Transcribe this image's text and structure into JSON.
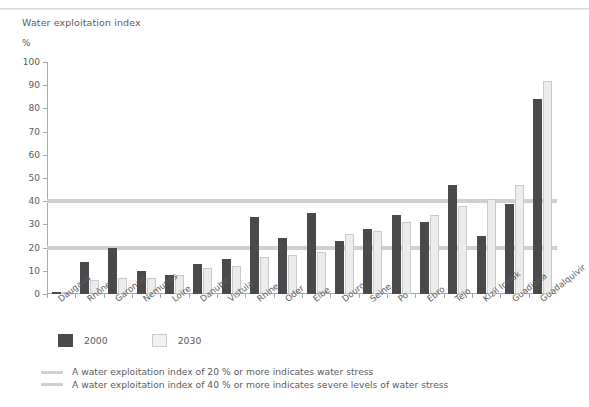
{
  "title": "Water exploitation index",
  "unit": "%",
  "legend": {
    "series1": "2000",
    "series2": "2030"
  },
  "notes": [
    "A water exploitation index of 20 % or more indicates water stress",
    "A water exploitation index of 40 % or more indicates severe levels of water stress"
  ],
  "colors": {
    "series_2000": "#4a4a4d",
    "series_2030": "#ececea",
    "reference_line": "#cfd0d2",
    "axis": "#a9aaad",
    "text": "#5b5c60"
  },
  "chart_data": {
    "type": "bar",
    "title": "Water exploitation index",
    "xlabel": "",
    "ylabel": "%",
    "ylim": [
      0,
      100
    ],
    "yticks": [
      0,
      10,
      20,
      30,
      40,
      50,
      60,
      70,
      80,
      90,
      100
    ],
    "grid": false,
    "legend_position": "below-left",
    "categories": [
      "Daugava",
      "Rhône",
      "Garonne",
      "Nemunas",
      "Loire",
      "Danube",
      "Vistula",
      "Rhine",
      "Oder",
      "Elbe",
      "Douro",
      "Seine",
      "Po",
      "Ebro",
      "Tejo",
      "Kizil Irmak",
      "Guadiana",
      "Guadalquivir"
    ],
    "series": [
      {
        "name": "2000",
        "color": "#4a4a4d",
        "values": [
          1,
          14,
          20,
          10,
          8,
          13,
          15,
          33,
          24,
          35,
          23,
          28,
          34,
          31,
          47,
          25,
          39,
          84
        ]
      },
      {
        "name": "2030",
        "color": "#ececea",
        "values": [
          1,
          6,
          7,
          7,
          8,
          11,
          12,
          16,
          17,
          18,
          26,
          27,
          31,
          34,
          38,
          41,
          47,
          92
        ]
      }
    ],
    "reference_lines": [
      {
        "value": 20,
        "label": "A water exploitation index of 20 % or more indicates water stress"
      },
      {
        "value": 40,
        "label": "A water exploitation index of 40 % or more indicates severe levels of water stress"
      }
    ]
  }
}
